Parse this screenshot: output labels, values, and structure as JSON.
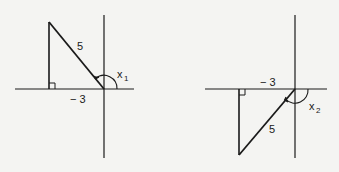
{
  "figures": [
    {
      "id": "left",
      "hypotenuse_label": "5",
      "leg_label": "− 3",
      "angle_label": "x",
      "angle_subscript": "1"
    },
    {
      "id": "right",
      "hypotenuse_label": "5",
      "leg_label": "− 3",
      "angle_label": "x",
      "angle_subscript": "2"
    }
  ],
  "colors": {
    "stroke": "#1a1a1a",
    "background": "#f4f4f2"
  }
}
